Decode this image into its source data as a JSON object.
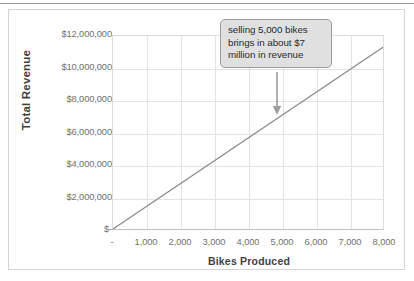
{
  "chart_data": {
    "type": "line",
    "title": "",
    "xlabel": "Bikes Produced",
    "ylabel": "Total Revenue",
    "xlim": [
      0,
      8000
    ],
    "ylim": [
      0,
      12000000
    ],
    "grid": true,
    "legend": "none",
    "x": [
      0,
      8000
    ],
    "values": [
      0,
      11300000
    ],
    "series": [
      {
        "name": "Total Revenue",
        "x": [
          0,
          8000
        ],
        "values": [
          0,
          11300000
        ],
        "color": "#8c8c8c"
      }
    ],
    "x_tick_labels": [
      "-",
      "1,000",
      "2,000",
      "3,000",
      "4,000",
      "5,000",
      "6,000",
      "7,000",
      "8,000"
    ],
    "x_tick_values": [
      0,
      1000,
      2000,
      3000,
      4000,
      5000,
      6000,
      7000,
      8000
    ],
    "y_tick_labels": [
      "$-",
      "$2,000,000",
      "$4,000,000",
      "$6,000,000",
      "$8,000,000",
      "$10,000,000",
      "$12,000,000"
    ],
    "y_tick_values": [
      0,
      2000000,
      4000000,
      6000000,
      8000000,
      10000000,
      12000000
    ],
    "annotations": [
      {
        "text": "selling 5,000 bikes brings in about $7 million in revenue",
        "point_x": 5000,
        "point_y": 7000000,
        "arrow": "down"
      }
    ]
  },
  "colors": {
    "series_line": "#8c8c8c",
    "gridline": "#e3e3e3",
    "axis": "#bfbfbf",
    "tick_text": "#707070",
    "axis_title_text": "#3f3f3f",
    "annotation_fill": "#e0e0e0",
    "annotation_border": "#9d9d9d",
    "annotation_text": "#2b2b2b",
    "frame_border": "#d4d4d4",
    "page_background": "#ffffff"
  }
}
